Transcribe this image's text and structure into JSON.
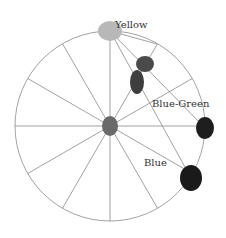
{
  "diagram": {
    "type": "color-wheel",
    "center": [
      110,
      126
    ],
    "radius": 95,
    "spoke_count": 12,
    "stroke_color": "#8a8a8a",
    "labels": [
      {
        "text": "Yellow",
        "x": 115,
        "y": 28
      },
      {
        "text": "Blue-Green",
        "x": 152,
        "y": 107
      },
      {
        "text": "Blue",
        "x": 144,
        "y": 166
      }
    ],
    "blobs": [
      {
        "name": "yellow-blob",
        "x": 110,
        "y": 31,
        "rx": 12,
        "ry": 10,
        "color": "#b8b8b8"
      },
      {
        "name": "center-blob",
        "x": 110,
        "y": 126,
        "rx": 8,
        "ry": 10,
        "color": "#6a6a6a"
      },
      {
        "name": "mix-blob-1",
        "x": 145,
        "y": 64,
        "rx": 9,
        "ry": 8,
        "color": "#4a4a4a"
      },
      {
        "name": "mix-blob-2",
        "x": 137,
        "y": 82,
        "rx": 7,
        "ry": 12,
        "color": "#3e3e3e"
      },
      {
        "name": "blue-green-blob",
        "x": 205,
        "y": 128,
        "rx": 9,
        "ry": 11,
        "color": "#1e1e1e"
      },
      {
        "name": "blue-blob",
        "x": 191,
        "y": 178,
        "rx": 11,
        "ry": 13,
        "color": "#1a1a1a"
      }
    ],
    "extra_lines": [
      {
        "from": [
          110,
          31
        ],
        "to": [
          205,
          128
        ]
      },
      {
        "from": [
          110,
          31
        ],
        "to": [
          191,
          178
        ]
      },
      {
        "from": [
          110,
          31
        ],
        "to": [
          157,
          44
        ]
      }
    ]
  }
}
